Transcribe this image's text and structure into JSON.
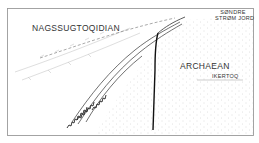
{
  "diagram": {
    "type": "geological-sketch-map",
    "labels": {
      "region_nw": "NAGSSUGTOQIDIAN",
      "region_se": "ARCHAEAN",
      "place_ne_line1": "SØNDRE",
      "place_ne_line2": "STRØM JORD",
      "place_e": "IKERTOQ"
    },
    "colors": {
      "ink": "#333333",
      "frame": "#9a9a9a",
      "stipple": "#b5b5b5",
      "background": "#ffffff"
    }
  }
}
